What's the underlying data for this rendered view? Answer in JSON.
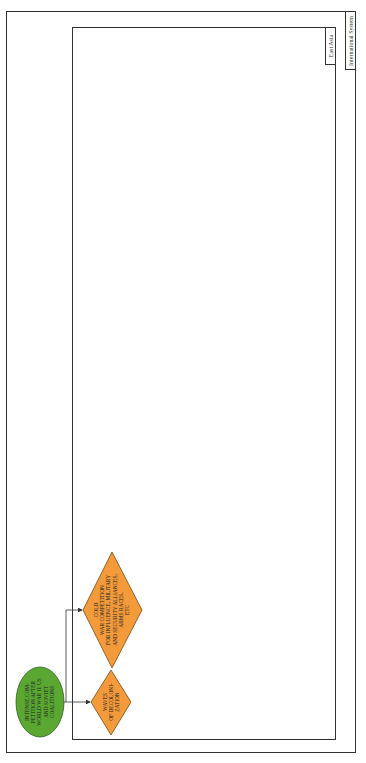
{
  "containers": {
    "outer": {
      "label": "International System"
    },
    "inner": {
      "label": "East Asia"
    }
  },
  "nodes": {
    "start": {
      "shape": "ellipse",
      "color": "#5aa832",
      "text": "INTENSE COM-\nPETITION AFTER\nWORLD WAR II: US\nAND SOVIET\nCOALITIONS"
    },
    "cold_war": {
      "shape": "diamond",
      "color": "#f39a3a",
      "text": "COLD\nWAR COMPETITION\nFOR INFLUENCE, MILITARY\nAND SECURITY ALLIANCES,\nARMS RACES,\nETC"
    },
    "decolonization": {
      "shape": "diamond",
      "color": "#f39a3a",
      "text": "WAVES\nOF DECOLONI-\nZATION"
    }
  },
  "edges": [
    {
      "from": "start",
      "to": "cold_war"
    },
    {
      "from": "start",
      "to": "decolonization"
    }
  ],
  "colors": {
    "border": "#333333",
    "edge": "#333333"
  }
}
